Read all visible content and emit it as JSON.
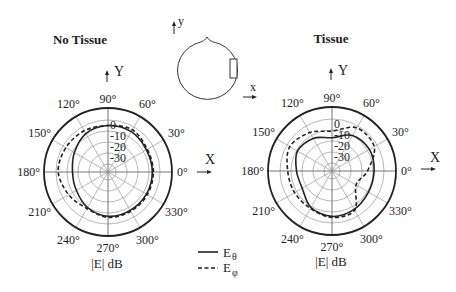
{
  "chart_data": [
    {
      "type": "polar",
      "title": "No Tissue",
      "center": [
        108,
        172
      ],
      "outer_radius": 64,
      "radial_axis": {
        "label": "|E| dB",
        "ticks": [
          "0",
          "-10",
          "-20",
          "-30"
        ],
        "tick_values": [
          0,
          -10,
          -20,
          -30
        ],
        "ring_radius_px": [
          52,
          41,
          30,
          19,
          8
        ]
      },
      "angular_ticks": [
        "0°",
        "30°",
        "60°",
        "90°",
        "120°",
        "150°",
        "180°",
        "210°",
        "240°",
        "270°",
        "300°",
        "330°"
      ],
      "axes": {
        "x": "X",
        "y": "Y"
      },
      "angles_deg": [
        0,
        30,
        60,
        90,
        120,
        150,
        180,
        210,
        240,
        270,
        300,
        330
      ],
      "series": [
        {
          "name": "Eθ",
          "style": "solid",
          "values_db": [
            -7,
            -7,
            -5,
            -5,
            -7,
            -12,
            -15,
            -14,
            -10,
            -7,
            -7,
            -7
          ]
        },
        {
          "name": "Eφ",
          "style": "dashed",
          "values_db": [
            -6,
            -6,
            -3,
            -5,
            -4,
            -3,
            -2,
            -6,
            -9,
            -6,
            -6,
            -6
          ]
        }
      ]
    },
    {
      "type": "polar",
      "title": "Tissue",
      "center": [
        332,
        171
      ],
      "outer_radius": 64,
      "radial_axis": {
        "label": "|E| dB",
        "ticks": [
          "0",
          "-10",
          "-20",
          "-30"
        ],
        "tick_values": [
          0,
          -10,
          -20,
          -30
        ],
        "ring_radius_px": [
          52,
          41,
          30,
          19,
          8
        ]
      },
      "angular_ticks": [
        "0°",
        "30°",
        "60°",
        "90°",
        "120°",
        "150°",
        "180°",
        "210°",
        "240°",
        "270°",
        "300°",
        "330°"
      ],
      "axes": {
        "x": "X",
        "y": "Y"
      },
      "angles_deg": [
        0,
        30,
        60,
        90,
        120,
        150,
        180,
        210,
        240,
        270,
        300,
        330
      ],
      "series": [
        {
          "name": "Eθ",
          "style": "solid",
          "values_db": [
            -9,
            -8,
            -10,
            -17,
            -13,
            -11,
            -15,
            -16,
            -9,
            -6,
            -7,
            -9
          ]
        },
        {
          "name": "Eφ",
          "style": "dashed",
          "values_db": [
            -15,
            -3,
            -2,
            -11,
            -7,
            -3,
            -7,
            -8,
            -8,
            -5,
            -6,
            -22
          ]
        }
      ]
    }
  ],
  "legend": [
    {
      "label": "E",
      "sub": "θ",
      "style": "solid"
    },
    {
      "label": "E",
      "sub": "φ",
      "style": "dashed"
    }
  ],
  "head_diagram": {
    "y_label": "y",
    "x_label": "x"
  },
  "colors": {
    "ink": "#222222",
    "grid": "#9a9a9a",
    "background": "#ffffff"
  }
}
